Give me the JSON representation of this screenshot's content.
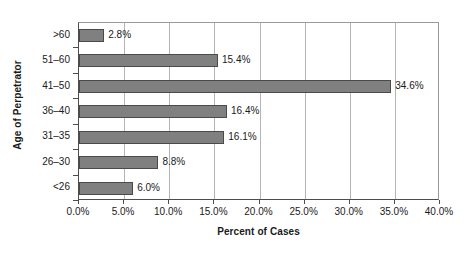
{
  "chart_data": {
    "type": "bar",
    "orientation": "horizontal",
    "title": "",
    "xlabel": "Percent of Cases",
    "ylabel": "Age of Perpetrator",
    "categories": [
      ">60",
      "51–60",
      "41–50",
      "36–40",
      "31–35",
      "26–30",
      "<26"
    ],
    "values": [
      2.8,
      15.4,
      34.6,
      16.4,
      16.1,
      8.8,
      6.0
    ],
    "data_labels": [
      "2.8%",
      "15.4%",
      "34.6%",
      "16.4%",
      "16.1%",
      "8.8%",
      "6.0%"
    ],
    "xlim": [
      0,
      40
    ],
    "xticks": [
      0,
      5,
      10,
      15,
      20,
      25,
      30,
      35,
      40
    ],
    "xtick_labels": [
      "0.0%",
      "5.0%",
      "10.0%",
      "15.0%",
      "20.0%",
      "25.0%",
      "30.0%",
      "35.0%",
      "40.0%"
    ],
    "grid": "vertical",
    "legend": "none",
    "bar_color": "#808080",
    "bar_border_color": "#4a4a4a",
    "grid_color": "#b4b4b4",
    "axis_color": "#4d4d4d",
    "background": "#ffffff"
  }
}
